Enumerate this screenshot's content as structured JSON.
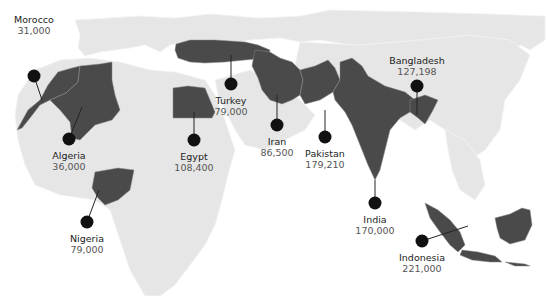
{
  "map": {
    "title": "",
    "colors": {
      "land": "#e6e6e6",
      "highlight": "#4a4a4a",
      "marker": "#111111",
      "background": "#ffffff"
    },
    "countries": [
      {
        "id": "morocco",
        "name": "Morocco",
        "value": "31,000",
        "marker": [
          34,
          76
        ],
        "label": [
          34,
          14
        ],
        "anchor": [
          42,
          100
        ]
      },
      {
        "id": "algeria",
        "name": "Algeria",
        "value": "36,000",
        "marker": [
          69,
          139
        ],
        "label": [
          69,
          152
        ],
        "anchor": [
          82,
          107
        ]
      },
      {
        "id": "nigeria",
        "name": "Nigeria",
        "value": "79,000",
        "marker": [
          87,
          222
        ],
        "label": [
          87,
          233
        ],
        "anchor": [
          99,
          190
        ]
      },
      {
        "id": "egypt",
        "name": "Egypt",
        "value": "108,400",
        "marker": [
          194,
          140
        ],
        "label": [
          194,
          153
        ],
        "anchor": [
          194,
          112
        ]
      },
      {
        "id": "turkey",
        "name": "Turkey",
        "value": "79,000",
        "marker": [
          231,
          84
        ],
        "label": [
          231,
          97
        ],
        "anchor": [
          231,
          55
        ]
      },
      {
        "id": "iran",
        "name": "Iran",
        "value": "86,500",
        "marker": [
          277,
          125
        ],
        "label": [
          277,
          138
        ],
        "anchor": [
          277,
          95
        ]
      },
      {
        "id": "pakistan",
        "name": "Pakistan",
        "value": "179,210",
        "marker": [
          325,
          137
        ],
        "label": [
          325,
          150
        ],
        "anchor": [
          325,
          110
        ]
      },
      {
        "id": "india",
        "name": "India",
        "value": "170,000",
        "marker": [
          375,
          203
        ],
        "label": [
          375,
          216
        ],
        "anchor": [
          375,
          180
        ]
      },
      {
        "id": "bangladesh",
        "name": "Bangladesh",
        "value": "127,198",
        "marker": [
          417,
          86
        ],
        "label": [
          417,
          40
        ],
        "anchor": [
          417,
          115
        ]
      },
      {
        "id": "indonesia",
        "name": "Indonesia",
        "value": "221,000",
        "marker": [
          422,
          241
        ],
        "label": [
          422,
          253
        ],
        "anchor": [
          468,
          226
        ]
      }
    ]
  }
}
